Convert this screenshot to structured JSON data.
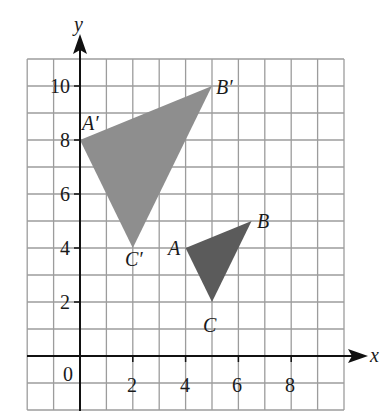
{
  "figure": {
    "axes": {
      "x_label": "x",
      "y_label": "y",
      "x_range": [
        -2,
        10
      ],
      "y_range": [
        -2,
        11
      ],
      "x_ticks": [
        {
          "value": 2,
          "label": "2"
        },
        {
          "value": 4,
          "label": "4"
        },
        {
          "value": 6,
          "label": "6"
        },
        {
          "value": 8,
          "label": "8"
        }
      ],
      "y_ticks": [
        {
          "value": 2,
          "label": "2"
        },
        {
          "value": 4,
          "label": "4"
        },
        {
          "value": 6,
          "label": "6"
        },
        {
          "value": 8,
          "label": "8"
        },
        {
          "value": 10,
          "label": "10"
        }
      ],
      "origin_label": "0",
      "grid": true
    },
    "triangles": [
      {
        "name": "ABC",
        "fill": "#5b5b5b",
        "vertices": [
          {
            "label": "A",
            "x": 4,
            "y": 4
          },
          {
            "label": "B",
            "x": 6.5,
            "y": 5
          },
          {
            "label": "C",
            "x": 5,
            "y": 2
          }
        ]
      },
      {
        "name": "A'B'C'",
        "fill": "#8e8e8e",
        "vertices": [
          {
            "label": "A′",
            "x": 0,
            "y": 8
          },
          {
            "label": "B′",
            "x": 5,
            "y": 10
          },
          {
            "label": "C′",
            "x": 2,
            "y": 4
          }
        ]
      }
    ],
    "colors": {
      "grid": "#9c9c9c",
      "axis": "#111111",
      "triangle_original": "#5b5b5b",
      "triangle_image": "#8e8e8e"
    }
  }
}
